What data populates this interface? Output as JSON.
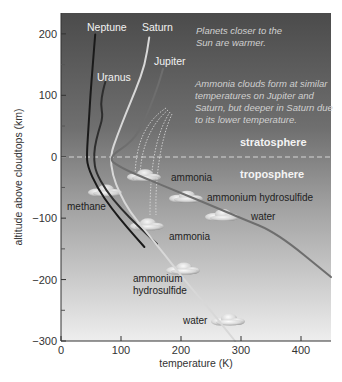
{
  "chart_data": {
    "type": "line",
    "title": "",
    "xlabel": "temperature (K)",
    "ylabel": "altitude above cloudtops (km)",
    "xlim": [
      0,
      450
    ],
    "ylim": [
      -300,
      234
    ],
    "x_ticks": [
      0,
      100,
      200,
      300,
      400
    ],
    "y_ticks": [
      -300,
      -200,
      -100,
      0,
      100,
      200
    ],
    "x_minor_ticks": [],
    "y_minor_ticks": [
      -250,
      -150,
      -50,
      50,
      150
    ],
    "grid": false,
    "legend": "none (series labeled directly on plot)",
    "series": [
      {
        "name": "Neptune",
        "color": "#1a1a1a",
        "label_pos": [
          43,
          217
        ],
        "points": [
          [
            57,
            199
          ],
          [
            53,
            150
          ],
          [
            49,
            100
          ],
          [
            46,
            50
          ],
          [
            43,
            5
          ],
          [
            44,
            -15
          ],
          [
            60,
            -50
          ],
          [
            85,
            -85
          ],
          [
            110,
            -115
          ],
          [
            139,
            -147
          ]
        ]
      },
      {
        "name": "Uranus",
        "color": "#2e2e2e",
        "label_pos": [
          68,
          130
        ],
        "points": [
          [
            74,
            122
          ],
          [
            70,
            108
          ],
          [
            66,
            85
          ],
          [
            70,
            65
          ],
          [
            62,
            40
          ],
          [
            56,
            15
          ],
          [
            55,
            -5
          ],
          [
            58,
            -25
          ],
          [
            75,
            -55
          ],
          [
            100,
            -85
          ],
          [
            128,
            -112
          ],
          [
            160,
            -142
          ]
        ]
      },
      {
        "name": "Saturn",
        "color": "#d8d8d8",
        "label_pos": [
          147,
          217
        ],
        "points": [
          [
            147,
            194
          ],
          [
            140,
            150
          ],
          [
            125,
            110
          ],
          [
            108,
            70
          ],
          [
            94,
            35
          ],
          [
            82,
            2
          ],
          [
            86,
            -30
          ],
          [
            98,
            -60
          ],
          [
            115,
            -90
          ],
          [
            140,
            -120
          ],
          [
            175,
            -162
          ],
          [
            205,
            -200
          ],
          [
            245,
            -245
          ],
          [
            290,
            -300
          ]
        ]
      },
      {
        "name": "Jupiter",
        "color": "#6e6e6e",
        "label_pos": [
          162,
          160
        ],
        "points": [
          [
            170,
            143
          ],
          [
            160,
            110
          ],
          [
            140,
            60
          ],
          [
            120,
            25
          ],
          [
            77,
            -2
          ],
          [
            100,
            -18
          ],
          [
            140,
            -35
          ],
          [
            190,
            -55
          ],
          [
            240,
            -75
          ],
          [
            300,
            -100
          ],
          [
            360,
            -124
          ],
          [
            450,
            -196
          ]
        ]
      }
    ],
    "cloud_layers": [
      {
        "planet": "Jupiter",
        "name": "ammonia",
        "temperature": 140,
        "altitude": -30
      },
      {
        "planet": "Jupiter",
        "name": "ammonium hydrosulfide",
        "temperature": 210,
        "altitude": -65
      },
      {
        "planet": "Jupiter",
        "name": "water",
        "temperature": 270,
        "altitude": -95
      },
      {
        "planet": "Saturn",
        "name": "ammonia",
        "temperature": 145,
        "altitude": -110
      },
      {
        "planet": "Saturn",
        "name": "ammonium hydrosulfide",
        "temperature": 205,
        "altitude": -182
      },
      {
        "planet": "Saturn",
        "name": "water",
        "temperature": 280,
        "altitude": -265
      },
      {
        "planet": "Uranus/Neptune",
        "name": "methane",
        "temperature": 75,
        "altitude": -55
      }
    ],
    "annotations": [
      {
        "text": "Planets closer to the Sun are warmer.",
        "lines": [
          "Planets closer to the",
          "Sun are warmer."
        ]
      },
      {
        "text": "Ammonia clouds form at similar temperatures on Jupiter and Saturn, but deeper in Saturn due to its lower temperature.",
        "lines": [
          "Ammonia clouds form at similar",
          "temperatures on Jupiter and",
          "Saturn, but deeper in Saturn due",
          "to its lower temperature."
        ]
      }
    ],
    "regions": [
      {
        "name": "stratosphere",
        "above_altitude": 0
      },
      {
        "name": "troposphere",
        "below_altitude": 0
      }
    ],
    "tropopause_altitude": 0
  },
  "labels": {
    "xlabel": "temperature (K)",
    "ylabel": "altitude above cloudtops (km)",
    "stratosphere": "stratosphere",
    "troposphere": "troposphere",
    "neptune": "Neptune",
    "saturn": "Saturn",
    "uranus": "Uranus",
    "jupiter": "Jupiter",
    "note1_line1": "Planets closer to the",
    "note1_line2": "Sun are warmer.",
    "note2_line1": "Ammonia clouds form at similar",
    "note2_line2": "temperatures on Jupiter and",
    "note2_line3": "Saturn, but deeper in Saturn due",
    "note2_line4": "to its lower temperature.",
    "methane": "methane",
    "ammonia_j": "ammonia",
    "ahs_j": "ammonium hydrosulfide",
    "water_j": "water",
    "ammonia_s": "ammonia",
    "ahs_s_line1": "ammonium",
    "ahs_s_line2": "hydrosulfide",
    "water_s": "water"
  },
  "colors": {
    "bg_top": "#4f4f4f",
    "bg_mid": "#8c8c8c",
    "bg_bottom": "#ececec",
    "axis": "#333333",
    "tropopause": "#cfcfcf"
  }
}
